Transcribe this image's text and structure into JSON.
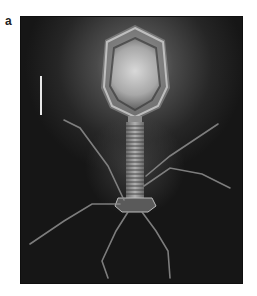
{
  "figure": {
    "panel_label": "a",
    "elements": {
      "capsid": "icosahedral head",
      "tail": "contractile tail sheath",
      "baseplate": "baseplate",
      "tail_fibers": "tail fibers",
      "scale_bar": "scale bar"
    },
    "colors": {
      "background": "#1b1b1b",
      "page": "#ffffff",
      "highlight": "#e8e8e8"
    }
  }
}
